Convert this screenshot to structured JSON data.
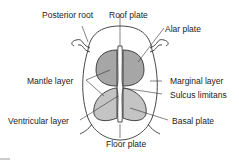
{
  "diagram": {
    "labels": {
      "posterior_root": "Posterior root",
      "roof_plate": "Roof plate",
      "alar_plate": "Alar plate",
      "mantle_layer": "Mantle layer",
      "marginal_layer": "Marginal layer",
      "sulcus_limitans": "Sulcus limitans",
      "ventricular_layer": "Ventricular layer",
      "basal_plate": "Basal plate",
      "floor_plate": "Floor plate"
    },
    "colors": {
      "alar_fill": "#a6a6a6",
      "basal_fill": "#c4c4c4",
      "outline": "#333333",
      "background": "#ffffff"
    }
  }
}
